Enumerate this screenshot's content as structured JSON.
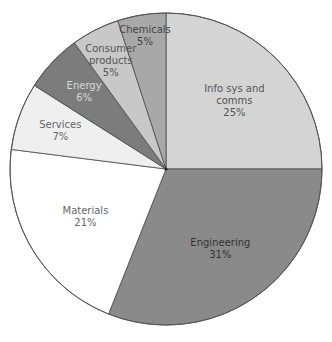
{
  "chart_data": {
    "type": "pie",
    "title": "",
    "start_angle": "12 o'clock",
    "direction": "clockwise",
    "categories": [
      "Info sys and comms",
      "Engineering",
      "Materials",
      "Services",
      "Energy",
      "Consumer products",
      "Chemicals"
    ],
    "values": [
      25,
      31,
      21,
      7,
      6,
      5,
      5
    ],
    "slices": [
      {
        "label_lines": [
          "Info sys and",
          "comms"
        ],
        "pct": "25%",
        "value": 25,
        "color": "#d4d4d4",
        "text_color": "#555555"
      },
      {
        "label_lines": [
          "Engineering"
        ],
        "pct": "31%",
        "value": 31,
        "color": "#8a8a8a",
        "text_color": "#333333"
      },
      {
        "label_lines": [
          "Materials"
        ],
        "pct": "21%",
        "value": 21,
        "color": "#ffffff",
        "text_color": "#666666"
      },
      {
        "label_lines": [
          "Services"
        ],
        "pct": "7%",
        "value": 7,
        "color": "#efefef",
        "text_color": "#666666"
      },
      {
        "label_lines": [
          "Energy"
        ],
        "pct": "6%",
        "value": 6,
        "color": "#7c7c7c",
        "text_color": "#d8d8d8"
      },
      {
        "label_lines": [
          "Consumer",
          "products"
        ],
        "pct": "5%",
        "value": 5,
        "color": "#c8c8c8",
        "text_color": "#555555"
      },
      {
        "label_lines": [
          "Chemicals"
        ],
        "pct": "5%",
        "value": 5,
        "color": "#a8a8a8",
        "text_color": "#444444"
      }
    ]
  }
}
